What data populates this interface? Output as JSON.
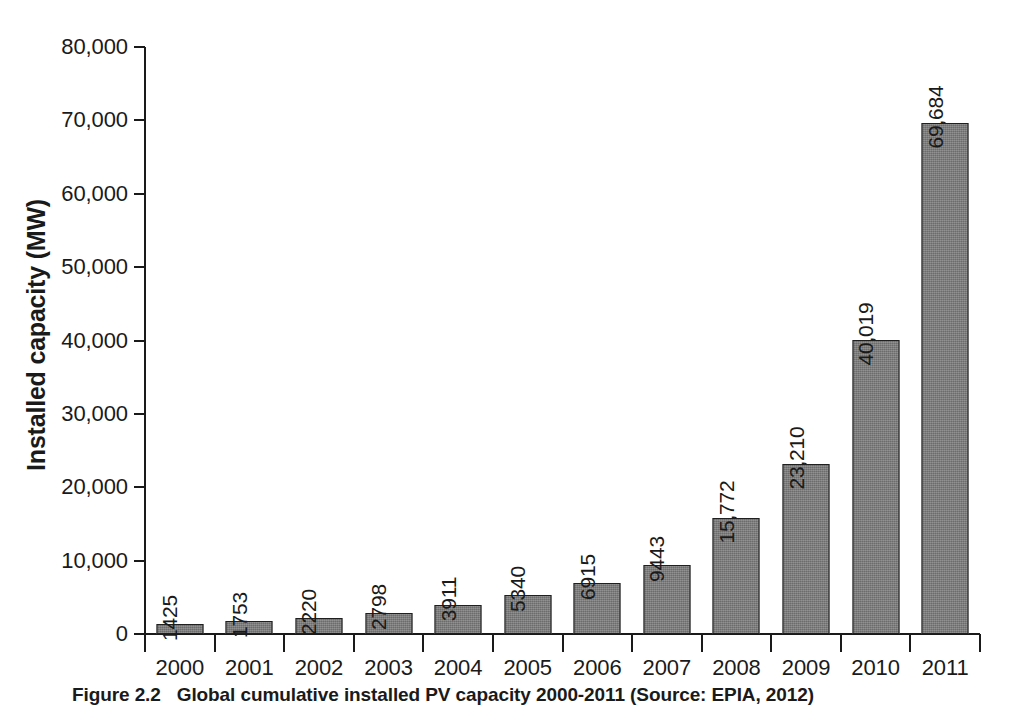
{
  "figure": {
    "caption_number": "Figure 2.2",
    "caption_text": "Global cumulative installed PV capacity 2000-2011 (Source: EPIA, 2012)"
  },
  "chart_data": {
    "type": "bar",
    "title": "",
    "xlabel": "",
    "ylabel": "Installed capacity (MW)",
    "categories": [
      "2000",
      "2001",
      "2002",
      "2003",
      "2004",
      "2005",
      "2006",
      "2007",
      "2008",
      "2009",
      "2010",
      "2011"
    ],
    "values": [
      1425,
      1753,
      2220,
      2798,
      3911,
      5340,
      6915,
      9443,
      15772,
      23210,
      40019,
      69684
    ],
    "value_labels": [
      "1425",
      "1753",
      "2220",
      "2798",
      "3911",
      "5340",
      "6915",
      "9443",
      "15,772",
      "23,210",
      "40,019",
      "69,684"
    ],
    "ylim": [
      0,
      80000
    ],
    "ytick_values": [
      80000,
      70000,
      60000,
      50000,
      40000,
      30000,
      20000,
      10000,
      0
    ],
    "ytick_labels": [
      "80,000",
      "70,000",
      "60,000",
      "50,000",
      "40,000",
      "30,000",
      "20,000",
      "10,000",
      "0"
    ],
    "grid": false,
    "legend": null,
    "bar_color": "#7b7b7b",
    "bar_edge_color": "#1f1f1f",
    "axis_color": "#1a1a1a",
    "background": "#ffffff"
  }
}
